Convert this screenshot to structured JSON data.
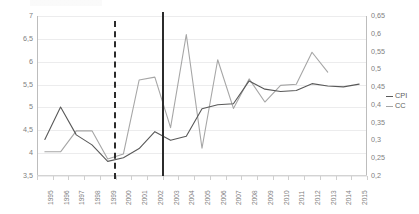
{
  "chart_data": {
    "type": "line",
    "title": "",
    "xlabel": "",
    "ylabel": "",
    "categories": [
      "1995",
      "1996",
      "1997",
      "1998",
      "1999",
      "2000",
      "2001",
      "2002",
      "2003",
      "2004",
      "2005",
      "2006",
      "2007",
      "2008",
      "2009",
      "2010",
      "2011",
      "2012",
      "2013",
      "2014",
      "2015"
    ],
    "grid": true,
    "legend_position": "right",
    "axes": {
      "left": {
        "label": "CPI",
        "min": 3.5,
        "max": 7,
        "step": 0.5,
        "ticks": [
          "3,5",
          "4",
          "4,5",
          "5",
          "5,5",
          "6",
          "6,5",
          "7"
        ],
        "tick_values": [
          3.5,
          4,
          4.5,
          5,
          5.5,
          6,
          6.5,
          7
        ]
      },
      "right": {
        "label": "CC",
        "min": 0.2,
        "max": 0.65,
        "step": 0.05,
        "ticks": [
          "0,2",
          "0,25",
          "0,3",
          "0,35",
          "0,4",
          "0,45",
          "0,5",
          "0,55",
          "0,6",
          "0,65"
        ],
        "tick_values": [
          0.2,
          0.25,
          0.3,
          0.35,
          0.4,
          0.45,
          0.5,
          0.55,
          0.6,
          0.65
        ]
      }
    },
    "series": [
      {
        "name": "CPI",
        "axis": "left",
        "color": "#595959",
        "values": [
          4.3,
          5.01,
          4.4,
          4.18,
          3.82,
          3.9,
          4.1,
          4.47,
          4.28,
          4.37,
          4.97,
          5.06,
          5.08,
          5.58,
          5.4,
          5.35,
          5.37,
          5.52,
          5.47,
          5.45,
          5.51
        ]
      },
      {
        "name": "CC",
        "axis": "right",
        "color": "#a6a6a6",
        "values": [
          0.268,
          0.268,
          0.327,
          0.327,
          0.248,
          0.262,
          0.47,
          0.478,
          0.336,
          0.598,
          0.278,
          0.527,
          0.39,
          0.473,
          0.408,
          0.455,
          0.458,
          0.548,
          0.492,
          null,
          null
        ]
      }
    ],
    "markers": [
      {
        "name": "dashed-event-line",
        "at": "1999.5",
        "style": "dashed"
      },
      {
        "name": "solid-event-line",
        "at": "2002.5",
        "style": "solid"
      }
    ]
  },
  "legend": {
    "items": [
      {
        "label": "CPI",
        "swatch": "cpi-line-swatch"
      },
      {
        "label": "CC",
        "swatch": "cc-line-swatch"
      }
    ]
  }
}
